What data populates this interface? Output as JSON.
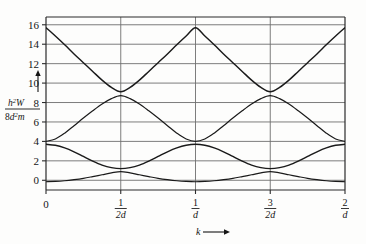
{
  "figure": {
    "background_color": "#fdfdfc",
    "frame_color": "#2b2b2b",
    "grid_color": "#6e6e6e",
    "curve_color": "#1a1a1a"
  },
  "axis_labels": {
    "y_label_numerator_base": "h",
    "y_label_numerator_sup": "2",
    "y_label_numerator_var": "W",
    "y_label_denominator_pre": "8",
    "y_label_denominator_base": "d",
    "y_label_denominator_sup": "2",
    "y_label_denominator_post": "m",
    "y_arrow": "up-arrow",
    "x_label": "k",
    "x_arrow": "right-arrow"
  },
  "chart_data": {
    "type": "line",
    "title": "",
    "xlabel": "k",
    "ylabel": "h²W / 8d²m",
    "xlim": [
      0,
      2
    ],
    "ylim": [
      -1,
      16.8
    ],
    "grid": true,
    "legend": "none",
    "y_ticks": [
      0,
      2,
      4,
      6,
      8,
      10,
      12,
      14,
      16
    ],
    "y_tick_labels": [
      "0",
      "2",
      "4",
      "6",
      "8",
      "10",
      "12",
      "14",
      "16"
    ],
    "x_ticks": [
      0,
      0.5,
      1,
      1.5,
      2
    ],
    "x_tick_labels": [
      "0",
      "1/2d",
      "1/d",
      "3/2d",
      "2/d"
    ],
    "x_tick_fracs": [
      {
        "num": "0",
        "den": ""
      },
      {
        "num": "1",
        "den": "2d"
      },
      {
        "num": "1",
        "den": "d"
      },
      {
        "num": "3",
        "den": "2d"
      },
      {
        "num": "2",
        "den": "d"
      }
    ],
    "series": [
      {
        "name": "band-1",
        "x": [
          0.0,
          0.0625,
          0.125,
          0.1875,
          0.25,
          0.3125,
          0.375,
          0.4375,
          0.5,
          0.5625,
          0.625,
          0.6875,
          0.75,
          0.8125,
          0.875,
          0.9375,
          1.0,
          1.0625,
          1.125,
          1.1875,
          1.25,
          1.3125,
          1.375,
          1.4375,
          1.5,
          1.5625,
          1.625,
          1.6875,
          1.75,
          1.8125,
          1.875,
          1.9375,
          2.0
        ],
        "y": [
          -0.15,
          -0.12,
          -0.05,
          0.06,
          0.2,
          0.38,
          0.57,
          0.76,
          0.9,
          0.76,
          0.57,
          0.38,
          0.2,
          0.06,
          -0.05,
          -0.12,
          -0.15,
          -0.12,
          -0.05,
          0.06,
          0.2,
          0.38,
          0.57,
          0.76,
          0.9,
          0.76,
          0.57,
          0.38,
          0.2,
          0.06,
          -0.05,
          -0.12,
          -0.15
        ]
      },
      {
        "name": "band-2",
        "x": [
          0.0,
          0.0625,
          0.125,
          0.1875,
          0.25,
          0.3125,
          0.375,
          0.4375,
          0.5,
          0.5625,
          0.625,
          0.6875,
          0.75,
          0.8125,
          0.875,
          0.9375,
          1.0,
          1.0625,
          1.125,
          1.1875,
          1.25,
          1.3125,
          1.375,
          1.4375,
          1.5,
          1.5625,
          1.625,
          1.6875,
          1.75,
          1.8125,
          1.875,
          1.9375,
          2.0
        ],
        "y": [
          3.7,
          3.6,
          3.33,
          2.93,
          2.45,
          1.97,
          1.56,
          1.3,
          1.2,
          1.3,
          1.56,
          1.97,
          2.45,
          2.93,
          3.33,
          3.6,
          3.7,
          3.6,
          3.33,
          2.93,
          2.45,
          1.97,
          1.56,
          1.3,
          1.2,
          1.3,
          1.56,
          1.97,
          2.45,
          2.93,
          3.33,
          3.6,
          3.7
        ]
      },
      {
        "name": "band-3",
        "x": [
          0.0,
          0.0625,
          0.125,
          0.1875,
          0.25,
          0.3125,
          0.375,
          0.4375,
          0.5,
          0.5625,
          0.625,
          0.6875,
          0.75,
          0.8125,
          0.875,
          0.9375,
          1.0,
          1.0625,
          1.125,
          1.1875,
          1.25,
          1.3125,
          1.375,
          1.4375,
          1.5,
          1.5625,
          1.625,
          1.6875,
          1.75,
          1.8125,
          1.875,
          1.9375,
          2.0
        ],
        "y": [
          4.0,
          4.25,
          4.85,
          5.62,
          6.4,
          7.15,
          7.85,
          8.4,
          8.7,
          8.4,
          7.85,
          7.15,
          6.4,
          5.62,
          4.85,
          4.25,
          4.0,
          4.25,
          4.85,
          5.62,
          6.4,
          7.15,
          7.85,
          8.4,
          8.7,
          8.4,
          7.85,
          7.15,
          6.4,
          5.62,
          4.85,
          4.25,
          4.0
        ]
      },
      {
        "name": "band-4",
        "x": [
          0.0,
          0.0625,
          0.125,
          0.1875,
          0.25,
          0.3125,
          0.375,
          0.4375,
          0.5,
          0.5625,
          0.625,
          0.6875,
          0.75,
          0.8125,
          0.875,
          0.9375,
          1.0,
          1.0625,
          1.125,
          1.1875,
          1.25,
          1.3125,
          1.375,
          1.4375,
          1.5,
          1.5625,
          1.625,
          1.6875,
          1.75,
          1.8125,
          1.875,
          1.9375,
          2.0
        ],
        "y": [
          15.7,
          14.85,
          13.95,
          13.0,
          12.1,
          11.2,
          10.3,
          9.55,
          9.1,
          9.55,
          10.3,
          11.2,
          12.1,
          13.0,
          13.95,
          14.85,
          15.7,
          14.85,
          13.95,
          13.0,
          12.1,
          11.2,
          10.3,
          9.55,
          9.1,
          9.55,
          10.3,
          11.2,
          12.1,
          13.0,
          13.95,
          14.85,
          15.7
        ]
      }
    ]
  }
}
